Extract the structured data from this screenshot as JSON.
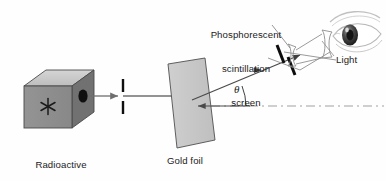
{
  "figure": {
    "background": "#fefefe"
  },
  "labels": {
    "source": "Radioactive\nsource\n(alpha particles)",
    "source_line1": "Radioactive",
    "source_line2": "source",
    "source_line3": "(alpha particles)",
    "gold_foil": "Gold foil",
    "screen": "Phosphorescent\nscintillation\nscreen",
    "screen_line1": "Phosphorescent",
    "screen_line2": "scintillation",
    "screen_line3": "screen",
    "light": "Light",
    "angle_symbol": "θ"
  },
  "components": {
    "source_box": {
      "name": "radioactive-source-box",
      "front_face_color": "#8f8f8f",
      "top_face_color": "#c9c9c9",
      "side_face_color": "#6e6e6e",
      "aperture_color": "#111111",
      "symbol": "asterisk"
    },
    "collimator": {
      "name": "collimator-slit",
      "bar_color": "#101010",
      "bar_count": 2
    },
    "gold_foil": {
      "name": "gold-foil-sheet",
      "fill": "#c6c6c6",
      "stroke": "#4a4a4a",
      "shape": "parallelogram"
    },
    "scintillation_screen": {
      "name": "scintillation-screen",
      "bar_color": "#0d0d0d",
      "bar_count": 2
    },
    "eyepiece": {
      "name": "eyepiece-lens-assembly",
      "stroke": "#8a8a8a"
    },
    "eye": {
      "name": "observer-eye",
      "outline": "#b4b4b4",
      "iris": "#555555",
      "pupil": "#1d1d1d"
    },
    "beams": {
      "incident_beam_color": "#6f6f6f",
      "scattered_beam_color": "#4a4a4a",
      "axis_line_color": "#9a9a9a",
      "axis_style": "dash-dot"
    }
  },
  "geometry": {
    "scattering_angle_deg": 22,
    "axis_y": 106,
    "foil_center_x": 192
  }
}
